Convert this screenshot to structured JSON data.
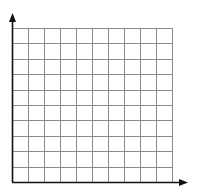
{
  "diagram": {
    "type": "blank-coordinate-grid",
    "quadrant": "first",
    "columns": 10,
    "rows": 10,
    "axes": {
      "x_axis": {
        "has_arrow": true,
        "direction": "right"
      },
      "y_axis": {
        "has_arrow": true,
        "direction": "up"
      }
    },
    "labels": [],
    "colors": {
      "background": "#ffffff",
      "grid_line": "#8a8a8a",
      "axis": "#111111"
    }
  }
}
